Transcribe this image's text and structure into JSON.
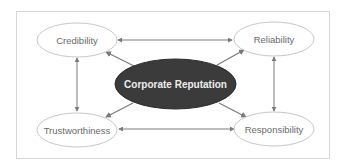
{
  "diagram": {
    "title": "Corporate Reputation",
    "center": {
      "label": "Corporate Reputation",
      "fill": "#3b3b3b",
      "text_color": "#eeeeee"
    },
    "nodes": [
      {
        "id": "credibility",
        "label": "Credibility",
        "position": "top-left"
      },
      {
        "id": "reliability",
        "label": "Reliability",
        "position": "top-right"
      },
      {
        "id": "trustworthiness",
        "label": "Trustworthiness",
        "position": "bottom-left"
      },
      {
        "id": "responsibility",
        "label": "Responsibility",
        "position": "bottom-right"
      }
    ],
    "edges": [
      {
        "from": "center",
        "to": "credibility",
        "type": "arrow"
      },
      {
        "from": "center",
        "to": "reliability",
        "type": "arrow"
      },
      {
        "from": "center",
        "to": "trustworthiness",
        "type": "arrow"
      },
      {
        "from": "center",
        "to": "responsibility",
        "type": "arrow"
      },
      {
        "from": "credibility",
        "to": "reliability",
        "type": "double-arrow"
      },
      {
        "from": "trustworthiness",
        "to": "responsibility",
        "type": "double-arrow"
      },
      {
        "from": "credibility",
        "to": "trustworthiness",
        "type": "double-arrow"
      },
      {
        "from": "reliability",
        "to": "responsibility",
        "type": "double-arrow"
      }
    ],
    "colors": {
      "node_stroke": "#c8c8c8",
      "edge": "#7a7a7a",
      "frame": "#d8d8d8",
      "node_text": "#6a6a6a"
    }
  }
}
